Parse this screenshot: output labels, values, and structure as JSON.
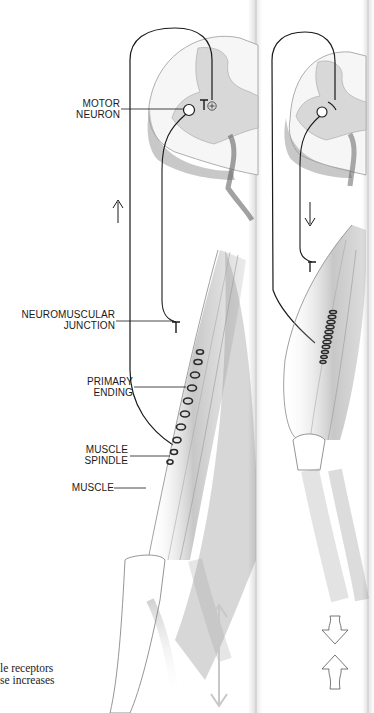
{
  "figure": {
    "panels": [
      {
        "id": "left",
        "state": "stretched",
        "direction_arrow": "up",
        "bottom_arrow": "double-headed-vertical"
      },
      {
        "id": "right",
        "state": "contracted",
        "direction_arrow": "down",
        "bottom_arrow": "converging-arrows"
      }
    ],
    "labels": {
      "motor_neuron": {
        "line1": "MOTOR",
        "line2": "NEURON"
      },
      "neuromuscular_junction": {
        "line1": "NEUROMUSCULAR",
        "line2": "JUNCTION"
      },
      "primary_ending": {
        "line1": "PRIMARY",
        "line2": "ENDING"
      },
      "muscle_spindle": {
        "line1": "MUSCLE",
        "line2": "SPINDLE"
      },
      "muscle": {
        "line1": "MUSCLE"
      }
    },
    "synapse_symbol": "⊕",
    "caption": {
      "line1": "le receptors",
      "line2": "se increases"
    }
  },
  "colors": {
    "ink": "#1a1a1a",
    "gray_matter": "#d9d9d9",
    "shading": "#8a8a8a",
    "page_strip": "#e6e6e6"
  }
}
